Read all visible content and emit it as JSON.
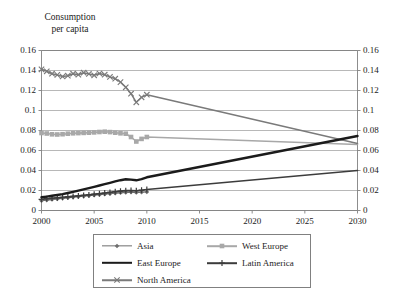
{
  "chart_data": {
    "type": "line",
    "title_lines": [
      "Consumption",
      "per capita"
    ],
    "xlabel": "",
    "ylabel": "",
    "xlim": [
      2000,
      2030
    ],
    "ylim": [
      0,
      0.16
    ],
    "grid": true,
    "grid_axis": "y",
    "dual_y_axis": true,
    "legend_position": "bottom",
    "legend_columns": 2,
    "xticks": [
      2000,
      2005,
      2010,
      2015,
      2020,
      2025,
      2030
    ],
    "xtick_labels": [
      "2000",
      "2005",
      "2010",
      "2015",
      "2020",
      "2025",
      "2030"
    ],
    "yticks": [
      0,
      0.02,
      0.04,
      0.06,
      0.08,
      0.1,
      0.12,
      0.14,
      0.16
    ],
    "ytick_labels": [
      "0",
      "0.02",
      "0.04",
      "0.06",
      "0.08",
      "0.1",
      "0.12",
      "0.14",
      "0.16"
    ],
    "ytick_labels_right": [
      "0",
      "0.02",
      "0.04",
      "0.06",
      "0.08",
      "0.1",
      "0.12",
      "0.14",
      "0.16"
    ],
    "series": [
      {
        "name": "Asia",
        "color": "#6e6e6e",
        "marker": "diamond",
        "width": 1.3,
        "x": [
          2000,
          2000.5,
          2001,
          2001.5,
          2002,
          2002.5,
          2003,
          2003.5,
          2004,
          2004.5,
          2005,
          2005.5,
          2006,
          2006.5,
          2007,
          2007.5,
          2008,
          2008.5,
          2009,
          2009.5,
          2010
        ],
        "values": [
          0.0098,
          0.0104,
          0.011,
          0.0116,
          0.0122,
          0.0127,
          0.0133,
          0.0138,
          0.0143,
          0.0148,
          0.0153,
          0.0158,
          0.0163,
          0.0168,
          0.0173,
          0.0177,
          0.0181,
          0.0184,
          0.018,
          0.0183,
          0.0186
        ]
      },
      {
        "name": "West Europe",
        "color": "#a8a8a8",
        "marker": "square",
        "width": 1.6,
        "x": [
          2000,
          2000.5,
          2001,
          2001.5,
          2002,
          2002.5,
          2003,
          2003.5,
          2004,
          2004.5,
          2005,
          2005.5,
          2006,
          2006.5,
          2007,
          2007.5,
          2008,
          2008.5,
          2009,
          2009.5,
          2010,
          2030
        ],
        "values": [
          0.0775,
          0.077,
          0.0762,
          0.076,
          0.0763,
          0.0768,
          0.0772,
          0.0774,
          0.0776,
          0.0778,
          0.0781,
          0.0785,
          0.0788,
          0.0784,
          0.0778,
          0.0772,
          0.0768,
          0.0735,
          0.069,
          0.0716,
          0.0735,
          0.066
        ]
      },
      {
        "name": "East Europe",
        "color": "#1b1b1b",
        "marker": "none",
        "width": 2.4,
        "x": [
          2000,
          2000.5,
          2001,
          2001.5,
          2002,
          2002.5,
          2003,
          2003.5,
          2004,
          2004.5,
          2005,
          2005.5,
          2006,
          2006.5,
          2007,
          2007.5,
          2008,
          2008.5,
          2009,
          2009.5,
          2010,
          2030
        ],
        "values": [
          0.0132,
          0.0139,
          0.0147,
          0.0155,
          0.0164,
          0.0175,
          0.0187,
          0.0199,
          0.0212,
          0.0224,
          0.0237,
          0.025,
          0.0263,
          0.0277,
          0.0291,
          0.0303,
          0.0312,
          0.0309,
          0.0302,
          0.0313,
          0.0332,
          0.0745
        ]
      },
      {
        "name": "Latin America",
        "color": "#3c3c3c",
        "marker": "cross",
        "width": 1.6,
        "x": [
          2000,
          2000.5,
          2001,
          2001.5,
          2002,
          2002.5,
          2003,
          2003.5,
          2004,
          2004.5,
          2005,
          2005.5,
          2006,
          2006.5,
          2007,
          2007.5,
          2008,
          2008.5,
          2009,
          2009.5,
          2010,
          2030
        ],
        "values": [
          0.0112,
          0.0118,
          0.0123,
          0.0127,
          0.0131,
          0.0136,
          0.0141,
          0.0146,
          0.0152,
          0.0157,
          0.0163,
          0.0169,
          0.0175,
          0.0181,
          0.0188,
          0.0194,
          0.0199,
          0.02,
          0.0198,
          0.0203,
          0.021,
          0.04
        ]
      },
      {
        "name": "North America",
        "color": "#7a7a7a",
        "marker": "x",
        "width": 1.5,
        "x": [
          2000,
          2000.5,
          2001,
          2001.5,
          2002,
          2002.5,
          2003,
          2003.5,
          2004,
          2004.5,
          2005,
          2005.5,
          2006,
          2006.5,
          2007,
          2007.5,
          2008,
          2008.5,
          2009,
          2009.5,
          2010,
          2030
        ],
        "values": [
          0.1412,
          0.1392,
          0.1368,
          0.1356,
          0.134,
          0.1348,
          0.1368,
          0.1358,
          0.1378,
          0.1366,
          0.1352,
          0.137,
          0.1358,
          0.1336,
          0.1318,
          0.1284,
          0.1232,
          0.1168,
          0.1082,
          0.1132,
          0.1158,
          0.067
        ]
      }
    ],
    "annotations": []
  },
  "legend": {
    "entries": [
      {
        "label": "Asia"
      },
      {
        "label": "West Europe"
      },
      {
        "label": "East Europe"
      },
      {
        "label": "Latin America"
      },
      {
        "label": "North America"
      }
    ]
  },
  "colors": {
    "axis": "#808080",
    "grid": "#9a9a9a",
    "text": "#1b1b1b",
    "background": "#ffffff"
  }
}
